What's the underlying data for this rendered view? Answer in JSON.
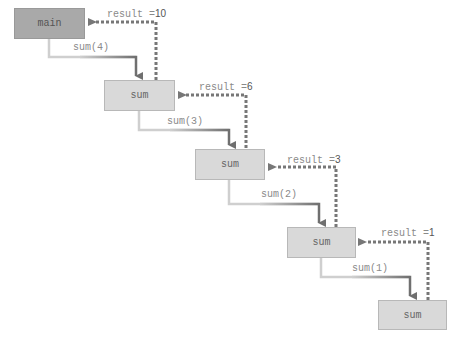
{
  "diagram": {
    "colors": {
      "main_fill": "#a9a9a9",
      "sum_fill": "#d9d9d9",
      "call_arrow_start": "#c8c8c8",
      "call_arrow_end": "#6f6f6f",
      "return_arrow": "#777777"
    },
    "frames": [
      {
        "id": "main",
        "label": "main"
      },
      {
        "id": "sum4",
        "label": "sum"
      },
      {
        "id": "sum3",
        "label": "sum"
      },
      {
        "id": "sum2",
        "label": "sum"
      },
      {
        "id": "sum1",
        "label": "sum"
      }
    ],
    "calls": [
      {
        "label": "sum(4)"
      },
      {
        "label": "sum(3)"
      },
      {
        "label": "sum(2)"
      },
      {
        "label": "sum(1)"
      }
    ],
    "returns": [
      {
        "prefix": "result =",
        "value": "10"
      },
      {
        "prefix": "result =",
        "value": "6"
      },
      {
        "prefix": "result =",
        "value": "3"
      },
      {
        "prefix": "result =",
        "value": "1"
      }
    ]
  }
}
